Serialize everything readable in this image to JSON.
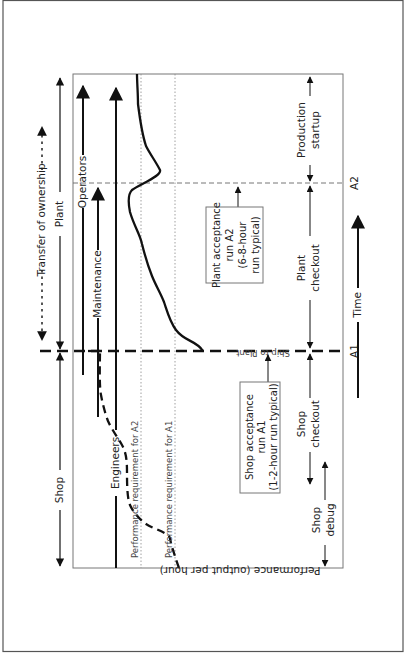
{
  "diagram": {
    "orientation": "rotated-90-ccw",
    "colors": {
      "line": "#111111",
      "frame": "#555555",
      "guide": "#888888",
      "background": "#ffffff"
    },
    "axes": {
      "y_label": "Performance (output per hour)",
      "x_label": "Time",
      "milestones": {
        "a1": "A1",
        "a2": "A2"
      }
    },
    "reference_lines": {
      "req_a2": "Performance requirement for A2",
      "req_a1": "Performance requirement for A1"
    },
    "event_label": "Ship to Plant",
    "ownership": {
      "transfer": "Transfer of ownership",
      "shop": "Shop",
      "plant": "Plant"
    },
    "roles": {
      "engineers": "Engineers",
      "maintenance": "Maintenance",
      "operators": "Operators"
    },
    "callouts": {
      "shop_acceptance": [
        "Shop acceptance",
        "run  A1",
        "(1-2-hour run typical)"
      ],
      "plant_acceptance": [
        "Plant acceptance",
        "run A2",
        "(6-8-hour",
        "run typical)"
      ]
    },
    "phases": {
      "shop_debug": [
        "Shop",
        "debug"
      ],
      "shop_checkout": [
        "Shop",
        "checkout"
      ],
      "plant_checkout": [
        "Plant",
        "checkout"
      ],
      "production_startup": [
        "Production",
        "startup"
      ]
    }
  }
}
